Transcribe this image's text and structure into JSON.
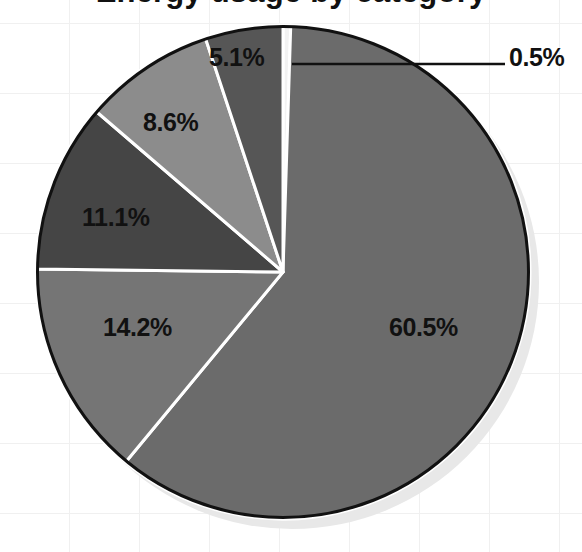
{
  "chart_data": {
    "type": "pie",
    "title": "Energy usage by category",
    "title_visible": false,
    "title_clipped_note": "title is cropped off the top of the screenshot; only descenders visible",
    "labels": [
      "0.5%",
      "60.5%",
      "14.2%",
      "11.1%",
      "8.6%",
      "5.1%"
    ],
    "values": [
      0.5,
      60.5,
      14.2,
      11.1,
      8.6,
      5.1
    ],
    "value_suffix": "%",
    "start_angle_deg": 0,
    "direction": "clockwise",
    "legend": "none",
    "grid": true,
    "background": "#ffffff",
    "grid_color": "#f0f0f0",
    "slices": [
      {
        "label": "0.5%",
        "value": 0.5,
        "color": "#f2f2f2",
        "label_placement": "callout-right"
      },
      {
        "label": "60.5%",
        "value": 60.5,
        "color": "#6b6b6b",
        "label_placement": "inside"
      },
      {
        "label": "14.2%",
        "value": 14.2,
        "color": "#757575",
        "label_placement": "inside"
      },
      {
        "label": "11.1%",
        "value": 11.1,
        "color": "#454545",
        "label_placement": "inside"
      },
      {
        "label": "8.6%",
        "value": 8.6,
        "color": "#8c8c8c",
        "label_placement": "inside"
      },
      {
        "label": "5.1%",
        "value": 5.1,
        "color": "#565656",
        "label_placement": "inside"
      }
    ],
    "style": {
      "outline_color": "#111111",
      "outline_width": 3,
      "separator_color": "#ffffff",
      "separator_width": 3,
      "shadow_color": "#e8e8e8",
      "leader_line_color": "#111111"
    }
  },
  "callout": {
    "label": "0.5%",
    "leader_from_x": 292,
    "leader_to_x": 505
  },
  "geometry": {
    "center_x": 283,
    "center_y": 272,
    "radius": 247
  }
}
